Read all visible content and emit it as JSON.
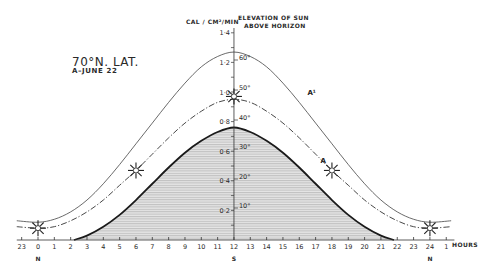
{
  "labels": {
    "title": "70°N. LAT.",
    "subtitle": "A–JUNE 22",
    "y_left_label": "CAL / CM²/MIN",
    "y_right_label_line1": "ELEVATION OF SUN",
    "y_right_label_line2": "ABOVE HORIZON",
    "x_unit": "HOURS",
    "curve_A_label": "A",
    "curve_A1_label": "A¹"
  },
  "chart_data": {
    "type": "area",
    "xlabel": "HOURS",
    "ylabel": "CAL / CM²/MIN",
    "y2label": "ELEVATION OF SUN ABOVE HORIZON",
    "x_ticks": [
      "23",
      "0",
      "1",
      "2",
      "3",
      "4",
      "5",
      "6",
      "7",
      "8",
      "9",
      "10",
      "11",
      "12",
      "13",
      "14",
      "15",
      "16",
      "17",
      "18",
      "19",
      "20",
      "21",
      "22",
      "23",
      "24",
      "1"
    ],
    "x_tick_hours": [
      -1,
      0,
      1,
      2,
      3,
      4,
      5,
      6,
      7,
      8,
      9,
      10,
      11,
      12,
      13,
      14,
      15,
      16,
      17,
      18,
      19,
      20,
      21,
      22,
      23,
      24,
      25
    ],
    "x_compass": [
      {
        "hour": 0,
        "label": "N"
      },
      {
        "hour": 12,
        "label": "S"
      },
      {
        "hour": 24,
        "label": "N"
      }
    ],
    "y_ticks": [
      "0·2",
      "0·4",
      "0·6",
      "0·8",
      "1·0",
      "1·2",
      "1·4"
    ],
    "y_tick_values": [
      0.2,
      0.4,
      0.6,
      0.8,
      1.0,
      1.2,
      1.4
    ],
    "y2_ticks": [
      "10°",
      "20°",
      "30°",
      "40°",
      "50°",
      "60°"
    ],
    "ylim": [
      0,
      1.45
    ],
    "xlim": [
      -1.3,
      25.5
    ],
    "grid": false,
    "series": [
      {
        "name": "A (radiation, June 22)",
        "style": "solid-thick-shaded",
        "x": [
          2.2,
          3,
          4,
          5,
          6,
          7,
          8,
          9,
          10,
          11,
          12,
          13,
          14,
          15,
          16,
          17,
          18,
          19,
          20,
          21,
          21.8
        ],
        "values": [
          0,
          0.03,
          0.09,
          0.17,
          0.27,
          0.38,
          0.49,
          0.59,
          0.67,
          0.73,
          0.76,
          0.73,
          0.67,
          0.59,
          0.49,
          0.38,
          0.27,
          0.17,
          0.09,
          0.03,
          0
        ]
      },
      {
        "name": "A¹ (elevation of sun)",
        "style": "dash-dot",
        "x": [
          -1.3,
          0,
          1,
          2,
          3,
          4,
          5,
          6,
          7,
          8,
          9,
          10,
          11,
          12,
          13,
          14,
          15,
          16,
          17,
          18,
          19,
          20,
          21,
          22,
          23,
          24,
          25.3
        ],
        "values": [
          0.09,
          0.08,
          0.09,
          0.13,
          0.19,
          0.27,
          0.37,
          0.47,
          0.58,
          0.69,
          0.79,
          0.87,
          0.93,
          0.95,
          0.93,
          0.87,
          0.79,
          0.69,
          0.58,
          0.47,
          0.37,
          0.27,
          0.19,
          0.13,
          0.09,
          0.08,
          0.09
        ]
      },
      {
        "name": "Upper envelope",
        "style": "solid-thin",
        "x": [
          -1.3,
          0,
          1,
          2,
          3,
          4,
          5,
          6,
          7,
          8,
          9,
          10,
          11,
          12,
          13,
          14,
          15,
          16,
          17,
          18,
          19,
          20,
          21,
          22,
          23,
          24,
          25.3
        ],
        "values": [
          0.13,
          0.12,
          0.14,
          0.19,
          0.27,
          0.38,
          0.51,
          0.65,
          0.79,
          0.93,
          1.06,
          1.17,
          1.24,
          1.27,
          1.24,
          1.17,
          1.06,
          0.93,
          0.79,
          0.65,
          0.51,
          0.38,
          0.27,
          0.19,
          0.14,
          0.12,
          0.13
        ]
      }
    ],
    "sun_markers": [
      {
        "hour": 0,
        "value": 0.08
      },
      {
        "hour": 6,
        "value": 0.47
      },
      {
        "hour": 12,
        "value": 0.97
      },
      {
        "hour": 18,
        "value": 0.47
      },
      {
        "hour": 24,
        "value": 0.08
      }
    ],
    "annotations": [
      {
        "text": "A",
        "hour": 17.3,
        "value": 0.52
      },
      {
        "text": "A¹",
        "hour": 16.5,
        "value": 0.98
      }
    ]
  }
}
